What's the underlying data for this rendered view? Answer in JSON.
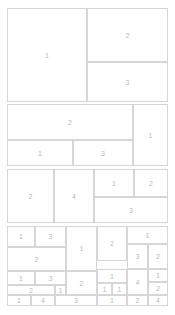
{
  "figure": {
    "kind": "treemap",
    "background_color": "#ffffff",
    "border_color": "#d6d6d6",
    "label_color": "#b9b9b9",
    "width": 175,
    "height": 315
  },
  "chart_data": {
    "type": "treemap",
    "title": "",
    "subtitle": "",
    "xlabel": "",
    "ylabel": "",
    "legend": [],
    "grid": false,
    "annotations": [],
    "note": "Squarified treemap of nested rectangles; each rectangle is labelled with its integer value. Rectangle geometry given in pixel coordinates of the 175x315 canvas.",
    "tiles": [
      {
        "label": "1",
        "value": 1,
        "x": 7,
        "y": 8,
        "w": 80,
        "h": 94
      },
      {
        "label": "2",
        "value": 2,
        "x": 87,
        "y": 8,
        "w": 81,
        "h": 54
      },
      {
        "label": "3",
        "value": 3,
        "x": 87,
        "y": 62,
        "w": 81,
        "h": 40
      },
      {
        "label": "2",
        "value": 2,
        "x": 7,
        "y": 104,
        "w": 126,
        "h": 36
      },
      {
        "label": "1",
        "value": 1,
        "x": 133,
        "y": 104,
        "w": 35,
        "h": 62
      },
      {
        "label": "1",
        "value": 1,
        "x": 7,
        "y": 140,
        "w": 66,
        "h": 26
      },
      {
        "label": "3",
        "value": 3,
        "x": 73,
        "y": 140,
        "w": 60,
        "h": 26
      },
      {
        "label": "2",
        "value": 2,
        "x": 7,
        "y": 169,
        "w": 47,
        "h": 54
      },
      {
        "label": "4",
        "value": 4,
        "x": 54,
        "y": 169,
        "w": 40,
        "h": 54
      },
      {
        "label": "1",
        "value": 1,
        "x": 94,
        "y": 169,
        "w": 40,
        "h": 28
      },
      {
        "label": "2",
        "value": 2,
        "x": 134,
        "y": 169,
        "w": 34,
        "h": 28
      },
      {
        "label": "3",
        "value": 3,
        "x": 94,
        "y": 197,
        "w": 74,
        "h": 26
      },
      {
        "label": "1",
        "value": 1,
        "x": 7,
        "y": 226,
        "w": 28,
        "h": 21
      },
      {
        "label": "3",
        "value": 3,
        "x": 35,
        "y": 226,
        "w": 31,
        "h": 21
      },
      {
        "label": "1",
        "value": 1,
        "x": 66,
        "y": 226,
        "w": 31,
        "h": 45
      },
      {
        "label": "2",
        "value": 2,
        "x": 97,
        "y": 226,
        "w": 30,
        "h": 35
      },
      {
        "label": "1",
        "value": 1,
        "x": 127,
        "y": 226,
        "w": 41,
        "h": 18
      },
      {
        "label": "3",
        "value": 3,
        "x": 127,
        "y": 244,
        "w": 21,
        "h": 25
      },
      {
        "label": "2",
        "value": 2,
        "x": 148,
        "y": 244,
        "w": 20,
        "h": 25
      },
      {
        "label": "2",
        "value": 2,
        "x": 7,
        "y": 247,
        "w": 59,
        "h": 24
      },
      {
        "label": "1",
        "value": 1,
        "x": 7,
        "y": 271,
        "w": 28,
        "h": 14
      },
      {
        "label": "3",
        "value": 3,
        "x": 35,
        "y": 271,
        "w": 31,
        "h": 14
      },
      {
        "label": "2",
        "value": 2,
        "x": 66,
        "y": 271,
        "w": 31,
        "h": 24
      },
      {
        "label": "1",
        "value": 1,
        "x": 97,
        "y": 269,
        "w": 30,
        "h": 14
      },
      {
        "label": "4",
        "value": 4,
        "x": 127,
        "y": 269,
        "w": 21,
        "h": 26
      },
      {
        "label": "1",
        "value": 1,
        "x": 148,
        "y": 269,
        "w": 20,
        "h": 13
      },
      {
        "label": "2",
        "value": 2,
        "x": 7,
        "y": 285,
        "w": 48,
        "h": 10
      },
      {
        "label": "1",
        "value": 1,
        "x": 55,
        "y": 285,
        "w": 11,
        "h": 10
      },
      {
        "label": "1",
        "value": 1,
        "x": 97,
        "y": 283,
        "w": 15,
        "h": 12
      },
      {
        "label": "1",
        "value": 1,
        "x": 112,
        "y": 283,
        "w": 15,
        "h": 12
      },
      {
        "label": "2",
        "value": 2,
        "x": 148,
        "y": 282,
        "w": 20,
        "h": 13
      },
      {
        "label": "1",
        "value": 1,
        "x": 7,
        "y": 295,
        "w": 24,
        "h": 11
      },
      {
        "label": "4",
        "value": 4,
        "x": 31,
        "y": 295,
        "w": 24,
        "h": 11
      },
      {
        "label": "3",
        "value": 3,
        "x": 55,
        "y": 295,
        "w": 42,
        "h": 11
      },
      {
        "label": "1",
        "value": 1,
        "x": 97,
        "y": 295,
        "w": 30,
        "h": 11
      },
      {
        "label": "2",
        "value": 2,
        "x": 127,
        "y": 295,
        "w": 21,
        "h": 11
      },
      {
        "label": "4",
        "value": 4,
        "x": 148,
        "y": 295,
        "w": 20,
        "h": 11
      }
    ]
  }
}
